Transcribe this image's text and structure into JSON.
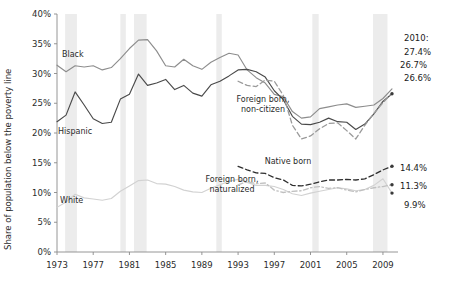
{
  "chart_data": {
    "type": "line",
    "title": "",
    "xlabel": "",
    "ylabel": "Share of population below the poverty line",
    "xlim": [
      1973,
      2010
    ],
    "ylim": [
      0,
      40
    ],
    "grid": false,
    "legend_position": "inline-labels",
    "y_ticks": [
      "0%",
      "5%",
      "10%",
      "15%",
      "20%",
      "25%",
      "30%",
      "35%",
      "40%"
    ],
    "y_tick_values": [
      0,
      5,
      10,
      15,
      20,
      25,
      30,
      35,
      40
    ],
    "x_ticks": [
      "1973",
      "1977",
      "1981",
      "1985",
      "1989",
      "1993",
      "1997",
      "2001",
      "2005",
      "2009"
    ],
    "x_tick_values": [
      1973,
      1977,
      1981,
      1985,
      1989,
      1993,
      1997,
      2001,
      2005,
      2009
    ],
    "annotations": [
      {
        "text": "2010:",
        "value": null
      },
      {
        "text": "27.4%",
        "value": 27.4
      },
      {
        "text": "26.7%",
        "value": 26.7
      },
      {
        "text": "26.6%",
        "value": 26.6
      },
      {
        "text": "14.4%",
        "value": 14.4
      },
      {
        "text": "11.3%",
        "value": 11.3
      },
      {
        "text": "9.9%",
        "value": 9.9
      }
    ],
    "recession_bands": [
      {
        "start": 1973.9,
        "end": 1975.2
      },
      {
        "start": 1980.0,
        "end": 1980.6
      },
      {
        "start": 1981.5,
        "end": 1982.9
      },
      {
        "start": 1990.6,
        "end": 1991.2
      },
      {
        "start": 2001.2,
        "end": 2001.9
      },
      {
        "start": 2007.9,
        "end": 2009.5
      }
    ],
    "series": [
      {
        "name": "Black",
        "label": "Black",
        "color": "#8d8d8d",
        "style": "solid",
        "x": [
          1973,
          1974,
          1975,
          1976,
          1977,
          1978,
          1979,
          1980,
          1981,
          1982,
          1983,
          1984,
          1985,
          1986,
          1987,
          1988,
          1989,
          1990,
          1991,
          1992,
          1993,
          1994,
          1995,
          1996,
          1997,
          1998,
          1999,
          2000,
          2001,
          2002,
          2003,
          2004,
          2005,
          2006,
          2007,
          2008,
          2009,
          2010
        ],
        "values": [
          31.4,
          30.3,
          31.3,
          31.1,
          31.3,
          30.6,
          31.0,
          32.5,
          34.2,
          35.6,
          35.7,
          33.8,
          31.3,
          31.1,
          32.4,
          31.3,
          30.7,
          31.9,
          32.7,
          33.4,
          33.1,
          30.6,
          29.3,
          28.4,
          26.5,
          26.1,
          23.6,
          22.5,
          22.7,
          24.1,
          24.4,
          24.7,
          24.9,
          24.3,
          24.5,
          24.7,
          25.8,
          27.4
        ]
      },
      {
        "name": "Hispanic",
        "label": "Hispanic",
        "color": "#4a4a4a",
        "style": "solid",
        "x": [
          1973,
          1974,
          1975,
          1976,
          1977,
          1978,
          1979,
          1980,
          1981,
          1982,
          1983,
          1984,
          1985,
          1986,
          1987,
          1988,
          1989,
          1990,
          1991,
          1992,
          1993,
          1994,
          1995,
          1996,
          1997,
          1998,
          1999,
          2000,
          2001,
          2002,
          2003,
          2004,
          2005,
          2006,
          2007,
          2008,
          2009,
          2010
        ],
        "values": [
          21.9,
          23.0,
          26.9,
          24.7,
          22.4,
          21.6,
          21.8,
          25.7,
          26.5,
          29.9,
          28.0,
          28.4,
          29.0,
          27.3,
          28.0,
          26.7,
          26.2,
          28.1,
          28.7,
          29.6,
          30.6,
          30.7,
          30.3,
          29.4,
          27.1,
          25.6,
          22.8,
          21.5,
          21.4,
          21.8,
          22.5,
          21.9,
          21.8,
          20.6,
          21.5,
          23.2,
          25.3,
          26.6
        ]
      },
      {
        "name": "White",
        "label": "White",
        "color": "#d2d2d2",
        "style": "solid",
        "x": [
          1973,
          1974,
          1975,
          1976,
          1977,
          1978,
          1979,
          1980,
          1981,
          1982,
          1983,
          1984,
          1985,
          1986,
          1987,
          1988,
          1989,
          1990,
          1991,
          1992,
          1993,
          1994,
          1995,
          1996,
          1997,
          1998,
          1999,
          2000,
          2001,
          2002,
          2003,
          2004,
          2005,
          2006,
          2007,
          2008,
          2009,
          2010
        ],
        "values": [
          7.5,
          8.4,
          9.7,
          9.1,
          8.9,
          8.7,
          9.0,
          10.2,
          11.1,
          12.0,
          12.1,
          11.5,
          11.4,
          11.0,
          10.4,
          10.1,
          10.0,
          10.7,
          11.3,
          11.9,
          12.2,
          11.7,
          11.2,
          11.2,
          11.0,
          10.5,
          9.8,
          9.5,
          9.9,
          10.2,
          10.5,
          10.8,
          10.6,
          10.3,
          10.5,
          11.2,
          12.3,
          9.9
        ]
      },
      {
        "name": "Foreign born, non-citizen",
        "label": "Foreign born,\nnon-citizen",
        "color": "#9a9a9a",
        "style": "dashed",
        "x": [
          1993,
          1994,
          1995,
          1996,
          1997,
          1998,
          1999,
          2000,
          2001,
          2002,
          2003,
          2004,
          2005,
          2006,
          2007,
          2008,
          2009,
          2010
        ],
        "values": [
          28.7,
          28.0,
          27.8,
          28.9,
          28.7,
          26.3,
          21.3,
          19.0,
          19.5,
          20.7,
          21.6,
          21.7,
          20.4,
          19.0,
          21.3,
          23.3,
          25.1,
          26.7
        ]
      },
      {
        "name": "Foreign born, naturalized",
        "label": "Foreign born,\nnaturalized",
        "color": "#c0c0c0",
        "style": "dashdot",
        "x": [
          1993,
          1994,
          1995,
          1996,
          1997,
          1998,
          1999,
          2000,
          2001,
          2002,
          2003,
          2004,
          2005,
          2006,
          2007,
          2008,
          2009,
          2010
        ],
        "values": [
          11.3,
          11.8,
          11.5,
          11.6,
          10.4,
          10.0,
          10.2,
          10.3,
          10.8,
          11.0,
          10.7,
          10.8,
          10.4,
          10.1,
          10.5,
          10.8,
          11.0,
          11.3
        ]
      },
      {
        "name": "Native born",
        "label": "Native born",
        "color": "#2f2f2f",
        "style": "dashed",
        "x": [
          1993,
          1994,
          1995,
          1996,
          1997,
          1998,
          1999,
          2000,
          2001,
          2002,
          2003,
          2004,
          2005,
          2006,
          2007,
          2008,
          2009,
          2010
        ],
        "values": [
          14.4,
          13.8,
          13.3,
          13.2,
          12.5,
          12.1,
          11.2,
          11.1,
          11.4,
          11.8,
          12.1,
          12.1,
          12.2,
          12.1,
          12.3,
          13.0,
          13.8,
          14.4
        ]
      }
    ]
  }
}
